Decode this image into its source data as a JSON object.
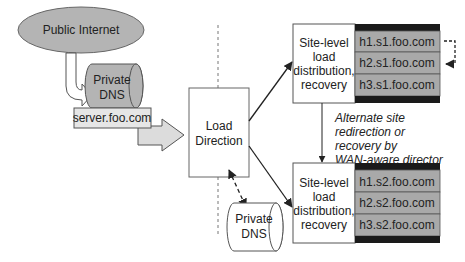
{
  "diagram": {
    "public_internet": {
      "label": "Public Internet"
    },
    "private_dns_top": {
      "line1": "Private",
      "line2": "DNS"
    },
    "server_box": {
      "label": "server.foo.com"
    },
    "load_direction": {
      "line1": "Load",
      "line2": "Direction"
    },
    "private_dns_bottom": {
      "line1": "Private",
      "line2": "DNS"
    },
    "site1": {
      "label_lines": [
        "Site-level",
        "load",
        "distribution,",
        "recovery"
      ],
      "hosts": [
        "h1.s1.foo.com",
        "h2.s1.foo.com",
        "h3.s1.foo.com"
      ]
    },
    "site2": {
      "label_lines": [
        "Site-level",
        "load",
        "distribution,",
        "recovery"
      ],
      "hosts": [
        "h1.s2.foo.com",
        "h2.s2.foo.com",
        "h3.s2.foo.com"
      ]
    },
    "annotation": {
      "lines": [
        "Alternate site",
        "redirection or",
        "recovery by",
        "WAN-aware director"
      ]
    },
    "colors": {
      "gray_fill": "#b4b4b4",
      "light_fill": "#e6e6e6",
      "host_fill": "#a9a9a9",
      "dark_band": "#1a1a1a",
      "stroke": "#555555"
    }
  }
}
